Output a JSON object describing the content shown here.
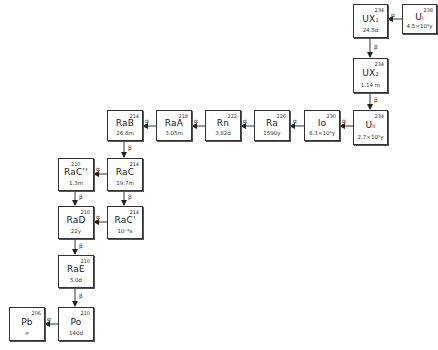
{
  "diagram": {
    "nodes": [
      {
        "id": "U238",
        "symbol": "U",
        "sub": "I",
        "mass": "238",
        "half_life": "4.5×10⁹y"
      },
      {
        "id": "UX1",
        "symbol": "UX",
        "sub": "1",
        "mass": "234",
        "half_life": "24.5d"
      },
      {
        "id": "UX2",
        "symbol": "UX",
        "sub": "2",
        "mass": "234",
        "half_life": "1.14 m"
      },
      {
        "id": "U234",
        "symbol": "U",
        "sub": "II",
        "mass": "234",
        "half_life": "2.7×10⁵y"
      },
      {
        "id": "Io",
        "symbol": "Io",
        "sub": "",
        "mass": "230",
        "half_life": "8.3×10⁴y"
      },
      {
        "id": "Ra",
        "symbol": "Ra",
        "sub": "",
        "mass": "226",
        "half_life": "1590y"
      },
      {
        "id": "Rn",
        "symbol": "Rn",
        "sub": "",
        "mass": "222",
        "half_life": "3.82d"
      },
      {
        "id": "RaA",
        "symbol": "RaA",
        "sub": "",
        "mass": "218",
        "half_life": "3.05m"
      },
      {
        "id": "RaB",
        "symbol": "RaB",
        "sub": "",
        "mass": "214",
        "half_life": "26.8m"
      },
      {
        "id": "RaC",
        "symbol": "RaC",
        "sub": "",
        "mass": "214",
        "half_life": "19.7m"
      },
      {
        "id": "RaC2",
        "symbol": "RaC''",
        "sub": "",
        "mass": "210",
        "half_life": "1.3m"
      },
      {
        "id": "RaC1",
        "symbol": "RaC'",
        "sub": "",
        "mass": "214",
        "half_life": "10⁻⁶s"
      },
      {
        "id": "RaD",
        "symbol": "RaD",
        "sub": "",
        "mass": "210",
        "half_life": "22y"
      },
      {
        "id": "RaE",
        "symbol": "RaE",
        "sub": "",
        "mass": "210",
        "half_life": "5.0d"
      },
      {
        "id": "Po",
        "symbol": "Po",
        "sub": "",
        "mass": "210",
        "half_life": "140d"
      },
      {
        "id": "Pb",
        "symbol": "Pb",
        "sub": "",
        "mass": "206",
        "half_life": "∞"
      }
    ],
    "edges": [
      {
        "from": "U238",
        "to": "UX1",
        "label": "α"
      },
      {
        "from": "UX1",
        "to": "UX2",
        "label": "β"
      },
      {
        "from": "UX2",
        "to": "U234",
        "label": "β"
      },
      {
        "from": "U234",
        "to": "Io",
        "label": "α"
      },
      {
        "from": "Io",
        "to": "Ra",
        "label": "α"
      },
      {
        "from": "Ra",
        "to": "Rn",
        "label": "α"
      },
      {
        "from": "Rn",
        "to": "RaA",
        "label": "α"
      },
      {
        "from": "RaA",
        "to": "RaB",
        "label": "α"
      },
      {
        "from": "RaB",
        "to": "RaC",
        "label": "β"
      },
      {
        "from": "RaC",
        "to": "RaC2",
        "label": "α"
      },
      {
        "from": "RaC",
        "to": "RaC1",
        "label": "β"
      },
      {
        "from": "RaC2",
        "to": "RaD",
        "label": "β"
      },
      {
        "from": "RaC1",
        "to": "RaD",
        "label": "α"
      },
      {
        "from": "RaD",
        "to": "RaE",
        "label": "β"
      },
      {
        "from": "RaE",
        "to": "Po",
        "label": "β"
      },
      {
        "from": "Po",
        "to": "Pb",
        "label": "α"
      }
    ]
  }
}
